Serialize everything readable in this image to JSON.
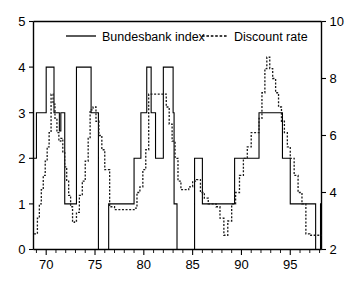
{
  "chart_data": {
    "type": "line",
    "title": "",
    "subtitle": "",
    "xlabel": "",
    "ylabel": "",
    "y2label": "",
    "grid": false,
    "legend_position": "top-center",
    "xlim": [
      68.7,
      98.2
    ],
    "xticks": [
      70,
      75,
      80,
      85,
      90,
      95
    ],
    "xtick_labels": [
      "70",
      "75",
      "80",
      "85",
      "90",
      "95"
    ],
    "xminor_step": 1,
    "ylim": [
      0,
      5
    ],
    "yticks": [
      0,
      1,
      2,
      3,
      4,
      5
    ],
    "ytick_labels": [
      "0",
      "1",
      "2",
      "3",
      "4",
      "5"
    ],
    "y2lim": [
      2,
      10
    ],
    "y2ticks": [
      2,
      4,
      6,
      8,
      10
    ],
    "y2tick_labels": [
      "2",
      "4",
      "6",
      "8",
      "10"
    ],
    "series": [
      {
        "name": "Bundesbank index",
        "axis": "left",
        "style": "solid",
        "interpolation": "step",
        "x": [
          68.75,
          69.0,
          69.5,
          70.0,
          70.3,
          70.8,
          71.1,
          71.35,
          71.5,
          71.7,
          71.9,
          72.1,
          72.55,
          73.0,
          73.1,
          74.3,
          74.6,
          74.9,
          75.2,
          75.35,
          76.2,
          76.4,
          78.7,
          79.0,
          79.4,
          79.7,
          80.3,
          80.5,
          80.75,
          81.0,
          81.2,
          81.35,
          82.0,
          82.2,
          83.0,
          83.1,
          83.25,
          83.4,
          84.4,
          85.2,
          85.5,
          86.0,
          87.9,
          88.2,
          89.0,
          89.3,
          91.8,
          92.8,
          93.4,
          94.2,
          95.0,
          95.2,
          97.6,
          97.9,
          98.1
        ],
        "values": [
          2,
          3,
          3,
          4,
          4,
          3,
          3,
          2.6,
          3,
          3,
          1,
          1,
          1,
          1,
          4,
          4,
          3,
          3,
          3,
          0,
          0,
          1,
          1,
          2,
          2,
          3,
          4,
          4,
          3,
          3,
          2,
          2,
          4,
          4,
          3,
          1,
          1,
          0,
          0,
          2,
          2,
          1,
          1,
          1,
          1,
          2,
          3,
          3,
          3,
          2,
          1,
          1,
          0,
          0,
          1
        ],
        "description": "Bundesbank index, step function on left axis (0-5 scale)"
      },
      {
        "name": "Discount rate",
        "axis": "right",
        "style": "dashed",
        "interpolation": "step",
        "x": [
          68.75,
          69.1,
          69.3,
          69.5,
          69.7,
          69.9,
          70.1,
          70.3,
          70.5,
          70.7,
          70.9,
          71.1,
          71.3,
          71.5,
          71.7,
          71.9,
          72.1,
          72.3,
          72.5,
          72.7,
          72.9,
          73.1,
          73.4,
          73.7,
          74.0,
          74.3,
          74.5,
          74.8,
          75.1,
          75.4,
          75.7,
          76.0,
          76.5,
          77.0,
          77.5,
          78.0,
          78.5,
          79.0,
          79.3,
          79.6,
          79.9,
          80.2,
          80.5,
          81.0,
          81.5,
          82.0,
          82.3,
          82.6,
          82.9,
          83.2,
          83.5,
          83.8,
          84.2,
          84.6,
          85.0,
          85.4,
          85.8,
          86.2,
          86.6,
          87.0,
          87.4,
          87.8,
          88.2,
          88.6,
          89.0,
          89.4,
          89.8,
          90.2,
          90.6,
          91.0,
          91.4,
          91.8,
          92.1,
          92.4,
          92.6,
          92.9,
          93.2,
          93.5,
          93.8,
          94.1,
          94.4,
          94.7,
          95.0,
          95.4,
          95.8,
          96.2,
          96.6,
          97.0,
          97.5,
          98.1
        ],
        "values": [
          2.55,
          3.1,
          3.6,
          4.1,
          4.6,
          5.1,
          5.6,
          6.1,
          7.45,
          7.1,
          6.6,
          6.1,
          5.8,
          5.9,
          5.4,
          4.9,
          4.4,
          3.9,
          3.5,
          2.95,
          3.0,
          3.3,
          3.9,
          4.4,
          5.1,
          5.9,
          6.9,
          7.0,
          6.5,
          6.0,
          5.5,
          4.8,
          3.5,
          3.4,
          3.4,
          3.4,
          3.4,
          3.45,
          4.0,
          4.2,
          4.8,
          5.5,
          7.45,
          7.45,
          7.45,
          7.45,
          7.0,
          6.4,
          5.8,
          5.2,
          4.4,
          4.1,
          4.1,
          4.2,
          4.4,
          4.45,
          4.0,
          3.8,
          3.6,
          3.6,
          3.5,
          3.1,
          2.5,
          3.0,
          3.6,
          4.0,
          4.6,
          5.2,
          5.6,
          6.1,
          6.1,
          6.6,
          7.5,
          8.35,
          8.75,
          8.35,
          8.0,
          7.5,
          7.0,
          6.5,
          6.1,
          5.6,
          5.2,
          4.6,
          4.0,
          3.6,
          2.55,
          2.5,
          2.5,
          2.5
        ],
        "description": "Discount rate, step function on right axis (2-10 percent scale)"
      }
    ]
  },
  "legend": {
    "items": [
      {
        "label": "Bundesbank index",
        "style": "solid"
      },
      {
        "label": "Discount rate",
        "style": "dashed"
      }
    ]
  },
  "axes": {
    "left": {
      "min_label": "0",
      "max_label": "5"
    },
    "right": {
      "min_label": "2",
      "max_label": "10"
    },
    "bottom": {
      "first_label": "70",
      "last_label": "95"
    }
  }
}
